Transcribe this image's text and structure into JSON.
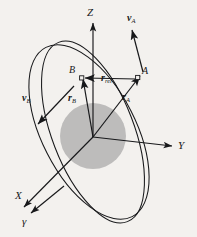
{
  "figure": {
    "kind": "orbital-mechanics-diagram",
    "background_color": "#f3f1ee",
    "ink_color": "#17181a",
    "body_color": "#b9b9b9",
    "canvas": {
      "width": 197,
      "height": 237
    }
  },
  "axes": {
    "origin_label": "",
    "z_label": "Z",
    "y_label": "Y",
    "x_label": "X",
    "gamma_label": "γ"
  },
  "bodies": {
    "central_body_label": "",
    "point_a_label": "A",
    "point_b_label": "B"
  },
  "vectors": {
    "r_a": {
      "symbol": "r",
      "subscript": "A"
    },
    "r_b": {
      "symbol": "r",
      "subscript": "B"
    },
    "r_rel": {
      "symbol": "r",
      "subscript": "rel"
    },
    "v_a": {
      "symbol": "v",
      "subscript": "A"
    },
    "v_b": {
      "symbol": "v",
      "subscript": "B"
    }
  },
  "orbits": {
    "orbit_a_name": "orbit-a",
    "orbit_b_name": "orbit-b"
  }
}
